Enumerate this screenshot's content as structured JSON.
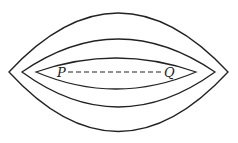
{
  "diagram": {
    "type": "nested-lens-contours",
    "stroke_color": "#222222",
    "background": "#ffffff",
    "contours": [
      {
        "name": "outer",
        "left_tip": [
          9,
          72
        ],
        "right_tip": [
          228,
          72
        ],
        "top_y": 13,
        "bottom_y": 132
      },
      {
        "name": "middle",
        "left_tip": [
          22,
          72
        ],
        "right_tip": [
          215,
          72
        ],
        "top_y": 39,
        "bottom_y": 107
      },
      {
        "name": "inner",
        "left_tip": [
          36,
          72
        ],
        "right_tip": [
          196,
          72
        ],
        "top_y": 58,
        "bottom_y": 89
      }
    ],
    "segment": {
      "from": "P",
      "to": "Q",
      "style": "dashed"
    },
    "labels": {
      "p": "P",
      "q": "Q"
    }
  }
}
